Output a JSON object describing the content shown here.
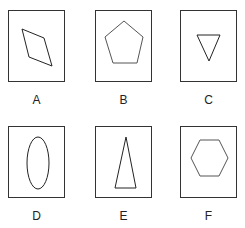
{
  "figure": {
    "panels": [
      {
        "label": "A",
        "shape": "rhombus"
      },
      {
        "label": "B",
        "shape": "pentagon"
      },
      {
        "label": "C",
        "shape": "inverted-triangle"
      },
      {
        "label": "D",
        "shape": "ellipse"
      },
      {
        "label": "E",
        "shape": "tall-triangle"
      },
      {
        "label": "F",
        "shape": "hexagon"
      }
    ]
  }
}
